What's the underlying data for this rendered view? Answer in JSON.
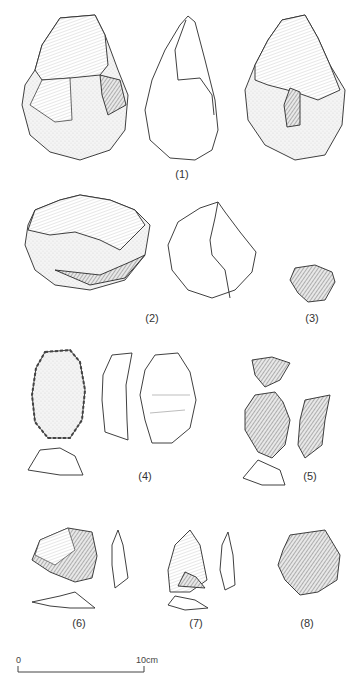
{
  "plate": {
    "description": "Line drawings of stone tools (lithic artifacts) with numbered specimens",
    "specimens": [
      {
        "id": 1,
        "label": "(1)",
        "views": [
          "dorsal face",
          "profile outline",
          "ventral face"
        ]
      },
      {
        "id": 2,
        "label": "(2)",
        "views": [
          "face",
          "outline"
        ]
      },
      {
        "id": 3,
        "label": "(3)",
        "views": [
          "face"
        ]
      },
      {
        "id": 4,
        "label": "(4)",
        "views": [
          "dorsal face",
          "profile",
          "ventral face",
          "cross-section"
        ]
      },
      {
        "id": 5,
        "label": "(5)",
        "views": [
          "top",
          "face",
          "profile",
          "cross-section"
        ]
      },
      {
        "id": 6,
        "label": "(6)",
        "views": [
          "face",
          "profile",
          "cross-section"
        ]
      },
      {
        "id": 7,
        "label": "(7)",
        "views": [
          "face",
          "profile",
          "cross-section"
        ]
      },
      {
        "id": 8,
        "label": "(8)",
        "views": [
          "face"
        ]
      }
    ],
    "scale_bar": {
      "start_label": "0",
      "end_label": "10cm"
    }
  }
}
